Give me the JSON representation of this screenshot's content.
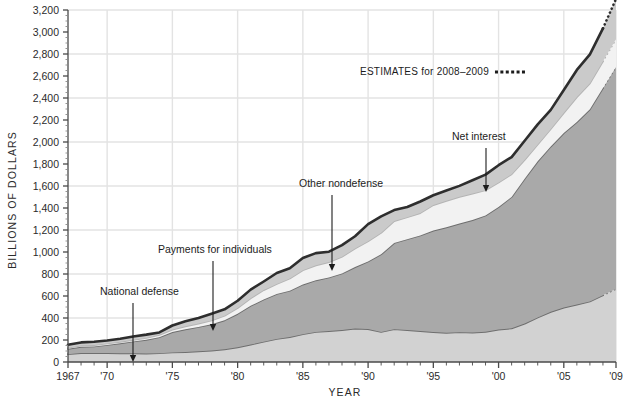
{
  "chart_data": {
    "type": "area",
    "title": "",
    "subtitle": "",
    "xlabel": "YEAR",
    "ylabel": "BILLIONS OF DOLLARS",
    "xlim": [
      1967,
      2009
    ],
    "ylim": [
      0,
      3200
    ],
    "ytick_step": 200,
    "ygrid_step": 400,
    "grid": true,
    "legend_position": "annotations",
    "stacked": true,
    "x": [
      1967,
      1968,
      1969,
      1970,
      1971,
      1972,
      1973,
      1974,
      1975,
      1976,
      1977,
      1978,
      1979,
      1980,
      1981,
      1982,
      1983,
      1984,
      1985,
      1986,
      1987,
      1988,
      1989,
      1990,
      1991,
      1992,
      1993,
      1994,
      1995,
      1996,
      1997,
      1998,
      1999,
      2000,
      2001,
      2002,
      2003,
      2004,
      2005,
      2006,
      2007,
      2008,
      2009
    ],
    "xtick_labels": [
      "1967",
      "'70",
      "'75",
      "'80",
      "'85",
      "'90",
      "'95",
      "'00",
      "'05",
      "'09"
    ],
    "xtick_values": [
      1967,
      1970,
      1975,
      1980,
      1985,
      1990,
      1995,
      2000,
      2005,
      2009
    ],
    "ytick_labels": [
      "0",
      "200",
      "400",
      "600",
      "800",
      "1,000",
      "1,200",
      "1,400",
      "1,600",
      "1,800",
      "2,000",
      "2,200",
      "2,400",
      "2,600",
      "2,800",
      "3,000",
      "3,200"
    ],
    "ytick_values": [
      0,
      200,
      400,
      600,
      800,
      1000,
      1200,
      1400,
      1600,
      1800,
      2000,
      2200,
      2400,
      2600,
      2800,
      3000,
      3200
    ],
    "estimate_start_year": 2008,
    "series": [
      {
        "name": "National defense",
        "color": "#d2d2d2",
        "line_color": "#6e6e6e",
        "values": [
          71,
          82,
          82,
          82,
          79,
          79,
          77,
          80,
          87,
          90,
          97,
          104,
          116,
          134,
          158,
          185,
          210,
          227,
          253,
          273,
          282,
          290,
          304,
          299,
          273,
          298,
          291,
          282,
          272,
          266,
          271,
          268,
          275,
          295,
          306,
          349,
          405,
          456,
          495,
          522,
          551,
          607,
          664
        ]
      },
      {
        "name": "Payments for individuals",
        "color": "#a9a9a9",
        "line_color": "#6e6e6e",
        "values": [
          49,
          56,
          60,
          73,
          91,
          108,
          125,
          146,
          185,
          207,
          222,
          239,
          263,
          304,
          353,
          384,
          409,
          421,
          451,
          470,
          487,
          515,
          559,
          615,
          707,
          784,
          826,
          869,
          923,
          958,
          987,
          1022,
          1057,
          1114,
          1195,
          1318,
          1419,
          1503,
          1586,
          1659,
          1746,
          1883,
          2020
        ]
      },
      {
        "name": "Net interest",
        "color": "#f2f2f2",
        "line_color": "#b4b4b4",
        "values": [
          10,
          11,
          12,
          14,
          14,
          15,
          17,
          21,
          23,
          27,
          30,
          35,
          42,
          53,
          69,
          85,
          90,
          111,
          130,
          136,
          139,
          152,
          169,
          184,
          195,
          199,
          199,
          203,
          232,
          241,
          244,
          241,
          230,
          223,
          206,
          171,
          153,
          160,
          184,
          227,
          237,
          243,
          249
        ]
      },
      {
        "name": "Other nondefense",
        "color": "#cacaca",
        "line_color": "#2e2e2e",
        "values": [
          27,
          29,
          30,
          27,
          27,
          30,
          30,
          22,
          37,
          47,
          52,
          61,
          58,
          66,
          78,
          78,
          100,
          93,
          112,
          111,
          95,
          106,
          111,
          155,
          149,
          100,
          93,
          105,
          89,
          94,
          99,
          121,
          141,
          157,
          156,
          173,
          183,
          173,
          207,
          247,
          263,
          300,
          367
        ]
      }
    ],
    "annotations": [
      {
        "label": "National defense",
        "text_x": 100,
        "text_y": 295,
        "arrow_x": 133,
        "arrow_y1": 303,
        "arrow_y2": 362
      },
      {
        "label": "Payments for individuals",
        "text_x": 158,
        "text_y": 253,
        "arrow_x": 213,
        "arrow_y1": 261,
        "arrow_y2": 331
      },
      {
        "label": "Other nondefense",
        "text_x": 299,
        "text_y": 187,
        "arrow_x": 332,
        "arrow_y1": 195,
        "arrow_y2": 271
      },
      {
        "label": "Net interest",
        "text_x": 452,
        "text_y": 140,
        "arrow_x": 486,
        "arrow_y1": 148,
        "arrow_y2": 192
      }
    ],
    "estimates_note": "ESTIMATES for 2008–2009"
  },
  "colors": {
    "background": "#ffffff",
    "grid": "#e3e3e3",
    "axis": "#4a4a4a",
    "text": "#2b2b2b",
    "top_line": "#1c1c1c"
  }
}
